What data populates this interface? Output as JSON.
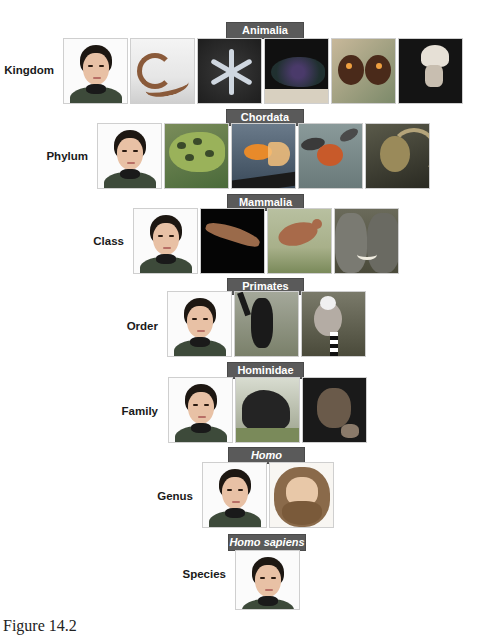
{
  "figure": {
    "caption": "Figure 14.2",
    "colors": {
      "badge_bg": "#5a5a5a",
      "badge_text": "#ffffff",
      "rank_text": "#1a1a1a"
    },
    "levels": [
      {
        "rank": "Kingdom",
        "taxon": "Animalia",
        "italic": false,
        "images": [
          "human-woman",
          "earthworm",
          "brittle-star",
          "sea-slug",
          "butterfly",
          "jellyfish"
        ]
      },
      {
        "rank": "Phylum",
        "taxon": "Chordata",
        "italic": false,
        "images": [
          "human-woman",
          "leopard-frog",
          "goldfish",
          "bird-in-flight",
          "lizard"
        ]
      },
      {
        "rank": "Class",
        "taxon": "Mammalia",
        "italic": false,
        "images": [
          "human-woman",
          "bat",
          "kangaroo",
          "elephants"
        ]
      },
      {
        "rank": "Order",
        "taxon": "Primates",
        "italic": false,
        "images": [
          "human-woman",
          "gibbon",
          "ring-tailed-lemur"
        ]
      },
      {
        "rank": "Family",
        "taxon": "Hominidae",
        "italic": false,
        "images": [
          "human-woman",
          "gorilla",
          "chimpanzee"
        ]
      },
      {
        "rank": "Genus",
        "taxon": "Homo",
        "italic": true,
        "images": [
          "human-woman",
          "neanderthal-illustration"
        ]
      },
      {
        "rank": "Species",
        "taxon": "Homo sapiens",
        "italic": true,
        "images": [
          "human-woman"
        ]
      }
    ]
  }
}
